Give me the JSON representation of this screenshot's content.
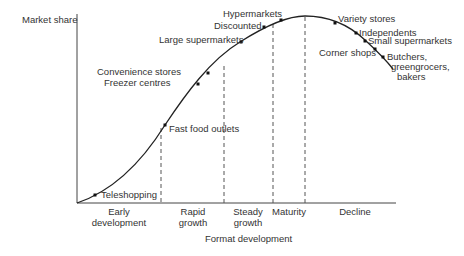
{
  "diagram": {
    "title": "",
    "y_axis_label": "Market share",
    "x_axis_label": "Format development",
    "stages": [
      {
        "line1": "Early",
        "line2": "development"
      },
      {
        "line1": "Rapid",
        "line2": "growth"
      },
      {
        "line1": "Steady",
        "line2": "growth"
      },
      {
        "line1": "Maturity",
        "line2": ""
      },
      {
        "line1": "Decline",
        "line2": ""
      }
    ],
    "points": [
      {
        "label": "Teleshopping",
        "stage": "Early development"
      },
      {
        "label": "Fast food outlets",
        "stage": "Rapid growth"
      },
      {
        "label": "Freezer centres",
        "stage": "Rapid growth"
      },
      {
        "label": "Convenience stores",
        "stage": "Rapid growth"
      },
      {
        "label": "Large supermarkets",
        "stage": "Steady growth"
      },
      {
        "label": "Discounted",
        "stage": "Steady growth"
      },
      {
        "label": "Hypermarkets",
        "stage": "Maturity"
      },
      {
        "label": "Variety stores",
        "stage": "Decline"
      },
      {
        "label": "Independents",
        "stage": "Decline"
      },
      {
        "label": "Small supermarkets",
        "stage": "Decline"
      },
      {
        "label": "Corner shops",
        "stage": "Decline"
      },
      {
        "label": "Butchers,",
        "label2": "greengrocers,",
        "label3": "bakers",
        "stage": "Decline"
      }
    ],
    "colors": {
      "line": "#222222",
      "text": "#333333",
      "dash": "#555555"
    }
  }
}
